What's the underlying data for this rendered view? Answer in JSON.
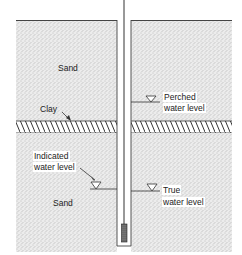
{
  "labels": {
    "sand_upper": "Sand",
    "clay": "Clay",
    "perched_line1": "Perched",
    "perched_line2": "water level",
    "indicated_line1": "Indicated",
    "indicated_line2": "water level",
    "sand_lower": "Sand",
    "true_line1": "True",
    "true_line2": "water level"
  },
  "colors": {
    "sand_stipple": "#9a9a9a",
    "sand_bg": "#e6e6e6",
    "line": "#333333"
  }
}
